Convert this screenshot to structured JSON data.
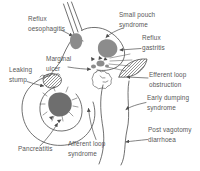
{
  "figure": {
    "kind": "anatomical line diagram of stomach after ulcer surgery with complication callouts"
  },
  "labels": {
    "reflux_oesophagitis": "Reflux\noesophagitis",
    "small_pouch_syndrome": "Small pouch\nsyndrome",
    "reflux_gastritis": "Reflux\ngastritis",
    "marginal_ulcer": "Marginal\nulcer",
    "leaking_stump": "Leaking\nstump",
    "efferent_loop_obstruction": "Efferent loop\nobstruction",
    "early_dumping_syndrome": "Early dumping\nsyndrome",
    "post_vagotomy_diarrhoea": "Post vagotomy\ndiarrhoea",
    "pancreatitis": "Pancreatitis",
    "afferent_loop_syndrome": "Afferent loop\nsyndrome"
  },
  "colors": {
    "line": "#4d4d4d",
    "shade": "#8c8c8c",
    "pancreas": "#6e6e6e",
    "text": "#585858",
    "background": "#ffffff"
  }
}
